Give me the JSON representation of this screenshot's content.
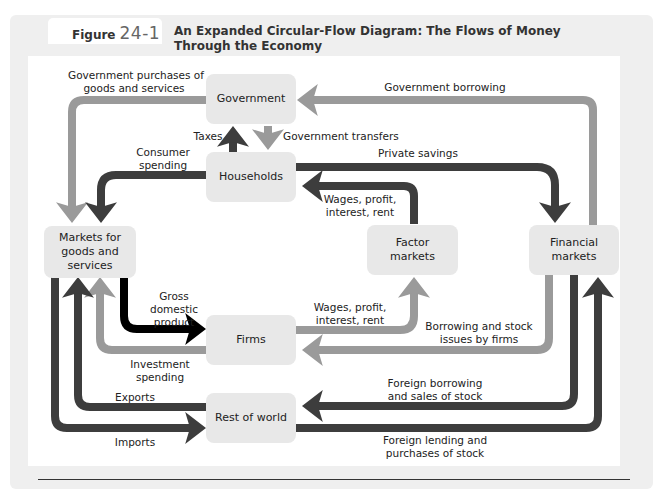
{
  "figure": {
    "label": "Figure",
    "number": "24-1",
    "title_line1": "An Expanded Circular-Flow Diagram: The Flows of Money",
    "title_line2": "Through the Economy"
  },
  "nodes": {
    "government": "Government",
    "households": "Households",
    "markets_goods_l1": "Markets for",
    "markets_goods_l2": "goods and",
    "markets_goods_l3": "services",
    "factor_l1": "Factor",
    "factor_l2": "markets",
    "financial_l1": "Financial",
    "financial_l2": "markets",
    "firms": "Firms",
    "rest_of_world": "Rest of world"
  },
  "flows": {
    "gov_purchases_l1": "Government purchases of",
    "gov_purchases_l2": "goods and services",
    "gov_borrowing": "Government borrowing",
    "taxes": "Taxes",
    "gov_transfers": "Government transfers",
    "consumer_l1": "Consumer",
    "consumer_l2": "spending",
    "private_savings": "Private savings",
    "wages_hh_l1": "Wages, profit,",
    "wages_hh_l2": "interest, rent",
    "gdp_l1": "Gross",
    "gdp_l2": "domestic",
    "gdp_l3": "product",
    "wages_firm_l1": "Wages, profit,",
    "wages_firm_l2": "interest, rent",
    "borrowing_firms_l1": "Borrowing and stock",
    "borrowing_firms_l2": "issues by firms",
    "investment_l1": "Investment",
    "investment_l2": "spending",
    "exports": "Exports",
    "imports": "Imports",
    "foreign_borrowing_l1": "Foreign borrowing",
    "foreign_borrowing_l2": "and sales of stock",
    "foreign_lending_l1": "Foreign lending and",
    "foreign_lending_l2": "purchases of stock"
  },
  "colors": {
    "dark_flow": "#3d3d3d",
    "light_flow": "#9a9a9a",
    "black_flow": "#000000",
    "box_fill": "#e8e8e8",
    "frame_bg": "#efefef"
  }
}
